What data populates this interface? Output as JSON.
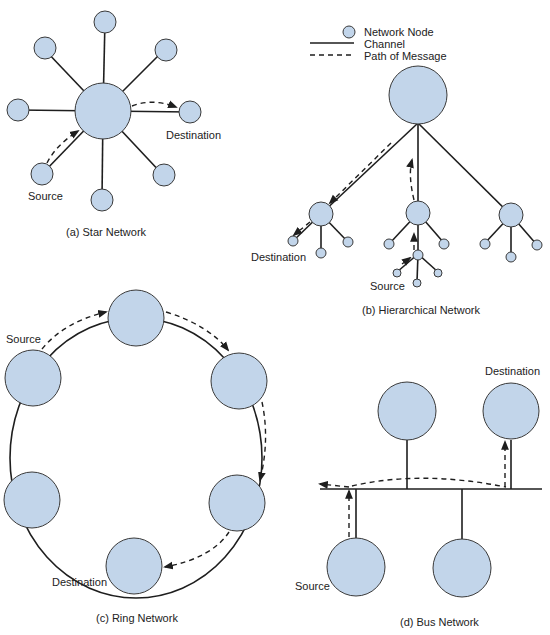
{
  "legend": {
    "node_label": "Network Node",
    "channel_label": "Channel",
    "path_label": "Path of Message"
  },
  "colors": {
    "node_fill": "#c2d5ea",
    "line": "#1e1e1e"
  },
  "star": {
    "caption": "(a) Star Network",
    "source_label": "Source",
    "destination_label": "Destination"
  },
  "hierarchical": {
    "caption": "(b) Hierarchical Network",
    "source_label": "Source",
    "destination_label": "Destination"
  },
  "ring": {
    "caption": "(c) Ring Network",
    "source_label": "Source",
    "destination_label": "Destination"
  },
  "bus": {
    "caption": "(d) Bus Network",
    "source_label": "Source",
    "destination_label": "Destination"
  }
}
